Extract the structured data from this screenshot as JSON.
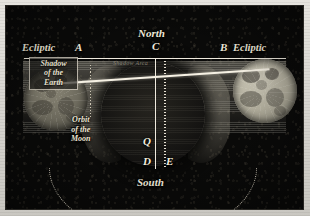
{
  "plate": {
    "kind": "antique-astronomical-engraving",
    "subject": "Lunar eclipse geometry: the Moon passing through the Earth's shadow"
  },
  "colors": {
    "mount": "#d8d6d0",
    "sky": "#0a0a09",
    "ink": "#f2ecdd",
    "umbra": "#1a1916",
    "penumbra": "#96928 5",
    "moon_lit": "#cdc9b9",
    "moon_dim": "#8c8878"
  },
  "labels": {
    "north": "North",
    "south": "South",
    "point_c": "C",
    "point_d": "D",
    "point_e": "E",
    "point_q": "Q",
    "point_a": "A",
    "point_b": "B",
    "ecliptic_left": "Ecliptic",
    "ecliptic_right": "Ecliptic",
    "shadow_box": "Shadow\nof the\nEarth",
    "shadow_box_l1": "Shadow",
    "shadow_box_l2": "of the",
    "shadow_box_l3": "Earth",
    "orbit_l1": "Orbit",
    "orbit_l2": "of the",
    "orbit_l3": "Moon",
    "band_text": "Shadow Area"
  },
  "figures": {
    "moon_left": "Moon entering the shadow",
    "moon_right": "Moon fully illuminated",
    "umbra": "Earth's umbra",
    "penumbra": "Earth's penumbra band",
    "orbit_arc": "Dotted orbit of the Moon",
    "sight_line": "Straight line joining the two Moon positions",
    "axis_vertical": "North-South axis C to D",
    "axis_dotted": "Dotted axis to E",
    "ecliptic_line": "Horizontal ecliptic line A to B"
  }
}
